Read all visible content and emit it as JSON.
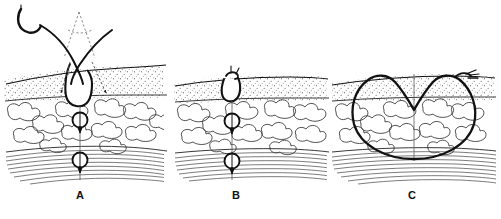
{
  "figure": {
    "type": "medical-illustration",
    "background_color": "#ffffff",
    "ink_color": "#111111",
    "panel_count": 3,
    "tissue_layers": [
      {
        "name": "epidermis-surface",
        "render": "solid-line"
      },
      {
        "name": "dermis",
        "render": "stipple"
      },
      {
        "name": "subcutaneous-fat",
        "render": "lobules"
      },
      {
        "name": "muscle-fascia",
        "render": "striations"
      }
    ],
    "panels": [
      {
        "id": "A",
        "label": "A",
        "caption_x": 80,
        "elements": [
          "curved-surgical-needle",
          "suture-thread-crossing",
          "dotted-path-guide-triangle",
          "guide-arrowheads",
          "wound-cavity",
          "deep-suture-knot-upper",
          "deep-suture-knot-lower"
        ]
      },
      {
        "id": "B",
        "label": "B",
        "caption_x": 236,
        "elements": [
          "closed-wound",
          "surface-knot",
          "deep-suture-knot-upper",
          "deep-suture-knot-lower"
        ]
      },
      {
        "id": "C",
        "label": "C",
        "caption_x": 412,
        "elements": [
          "large-deep-crescent-suture-loop",
          "suture-knot-right",
          "wound-midline"
        ]
      }
    ]
  }
}
